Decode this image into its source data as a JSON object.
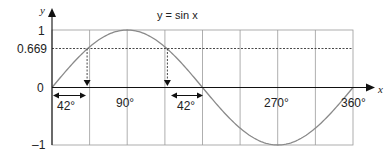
{
  "chart_data": {
    "type": "line",
    "title": "y = sin x",
    "xlabel": "x",
    "ylabel": "y",
    "xlim": [
      0,
      360
    ],
    "ylim": [
      -1,
      1
    ],
    "x_ticks": [
      {
        "value": 90,
        "label": "90°"
      },
      {
        "value": 270,
        "label": "270°"
      },
      {
        "value": 360,
        "label": "360°"
      }
    ],
    "y_ticks": [
      {
        "value": 1,
        "label": "1"
      },
      {
        "value": 0.669,
        "label": "0.669"
      },
      {
        "value": 0,
        "label": "0"
      },
      {
        "value": -1,
        "label": "–1"
      }
    ],
    "grid_x_every_deg": 45,
    "grid": true,
    "series": [
      {
        "name": "sin x",
        "function": "sin",
        "color": "#8a8a8a",
        "x": [
          0,
          45,
          90,
          135,
          180,
          225,
          270,
          315,
          360
        ],
        "values": [
          0,
          0.707,
          1,
          0.707,
          0,
          -0.707,
          -1,
          -0.707,
          0
        ]
      }
    ],
    "annotations": [
      {
        "type": "hline-dashed",
        "y": 0.669,
        "label": "0.669"
      },
      {
        "type": "vline-dashed-arrow",
        "x": 42,
        "from_y": 0.669,
        "to_y": 0
      },
      {
        "type": "vline-dashed-arrow",
        "x": 138,
        "from_y": 0.669,
        "to_y": 0
      },
      {
        "type": "double-arrow",
        "x_from": 0,
        "x_to": 42,
        "label": "42°"
      },
      {
        "type": "double-arrow",
        "x_from": 138,
        "x_to": 180,
        "label": "42°"
      }
    ]
  },
  "labels": {
    "title": "y = sin x",
    "x_axis": "x",
    "y_axis": "y",
    "y1": "1",
    "y0669": "0.669",
    "y0": "0",
    "yneg1": "–1",
    "x90": "90°",
    "x270": "270°",
    "x360": "360°",
    "angle_left": "42°",
    "angle_right": "42°"
  },
  "colors": {
    "axis": "#111111",
    "grid": "#9a9a9a",
    "curve": "#8a8a8a",
    "dashed": "#333333"
  }
}
